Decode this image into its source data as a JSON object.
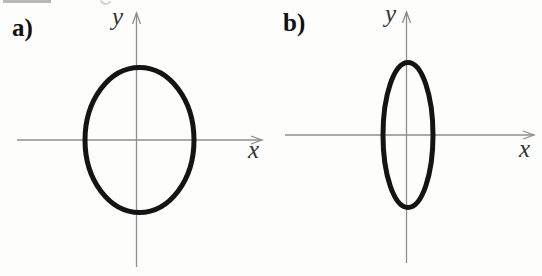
{
  "figure": {
    "width": 542,
    "height": 276,
    "background_color": "#fdfdfc",
    "axis_color": "#8e8e8e",
    "axis_stroke_width": 1.3,
    "curve_color": "#141414",
    "panel_label_color": "#111111",
    "axis_label_color": "#333333",
    "arrowhead": {
      "length": 11,
      "half_width": 4
    },
    "panels": [
      {
        "id": "a",
        "panel_label": "a)",
        "panel_label_pos": {
          "x": 12,
          "y": 36
        },
        "axes": {
          "x": {
            "label": "x",
            "y": 140,
            "from": 17,
            "to": 262,
            "label_pos": {
              "x": 248,
              "y": 158
            }
          },
          "y": {
            "label": "y",
            "x": 136.5,
            "from": 13,
            "to": 267,
            "label_pos": {
              "x": 112,
              "y": 25
            }
          }
        },
        "ellipse": {
          "cx": 139.5,
          "cy": 140,
          "rx": 54.5,
          "ry": 72.5,
          "stroke_width": 5
        }
      },
      {
        "id": "b",
        "panel_label": "b)",
        "panel_label_pos": {
          "x": 283,
          "y": 31
        },
        "axes": {
          "x": {
            "label": "x",
            "y": 135,
            "from": 285,
            "to": 534,
            "label_pos": {
              "x": 519,
              "y": 157
            }
          },
          "y": {
            "label": "y",
            "x": 406.5,
            "from": 12,
            "to": 263,
            "label_pos": {
              "x": 385,
              "y": 22
            }
          }
        },
        "ellipse": {
          "cx": 408,
          "cy": 135,
          "rx": 25,
          "ry": 72.5,
          "stroke_width": 5
        }
      }
    ],
    "scan_artifacts": [
      {
        "type": "bar",
        "x": 3,
        "y": 0,
        "width": 48,
        "height": 3,
        "color": "#b8b8b8"
      },
      {
        "type": "curl",
        "path": "M 100.5 0.5 Q 104.5 7 111 1.5",
        "color": "#c8c8c8"
      }
    ]
  }
}
